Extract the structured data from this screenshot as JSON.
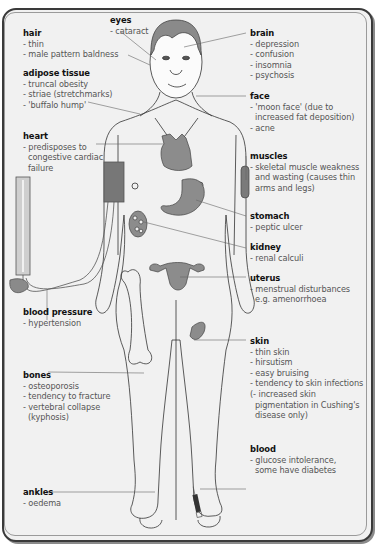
{
  "diagram": {
    "colors": {
      "background": "#f1f1f1",
      "frame": "#3a3a3a",
      "organ_fill": "#8c8c8c",
      "label_title": "#111111",
      "label_text": "#555555",
      "leader_line": "#666666"
    }
  },
  "labels": {
    "hair": {
      "title": "hair",
      "items": [
        "- thin",
        "- male pattern baldness"
      ]
    },
    "eyes": {
      "title": "eyes",
      "items": [
        "- cataract"
      ]
    },
    "adipose": {
      "title": "adipose tissue",
      "items": [
        "- truncal obesity",
        "- striae (stretchmarks)",
        "- 'buffalo hump'"
      ]
    },
    "heart": {
      "title": "heart",
      "items": [
        "- predisposes to",
        "congestive cardiac",
        "failure"
      ]
    },
    "blood_pressure": {
      "title": "blood pressure",
      "items": [
        "- hypertension"
      ]
    },
    "bones": {
      "title": "bones",
      "items": [
        "- osteoporosis",
        "- tendency to fracture",
        "- vertebral collapse",
        "(kyphosis)"
      ]
    },
    "ankles": {
      "title": "ankles",
      "items": [
        "- oedema"
      ]
    },
    "brain": {
      "title": "brain",
      "items": [
        "- depression",
        "- confusion",
        "- insomnia",
        "- psychosis"
      ]
    },
    "face": {
      "title": "face",
      "items": [
        "- 'moon face' (due to",
        "increased fat deposition)",
        "- acne"
      ]
    },
    "muscles": {
      "title": "muscles",
      "items": [
        "- skeletal muscle weakness",
        "and wasting (causes thin",
        "arms and legs)"
      ]
    },
    "stomach": {
      "title": "stomach",
      "items": [
        "- peptic ulcer"
      ]
    },
    "kidney": {
      "title": "kidney",
      "items": [
        "- renal calculi"
      ]
    },
    "uterus": {
      "title": "uterus",
      "items": [
        "- menstrual disturbances",
        "e.g. amenorrhoea"
      ]
    },
    "skin": {
      "title": "skin",
      "items": [
        "- thin skin",
        "- hirsutism",
        "- easy bruising",
        "- tendency to skin infections",
        "(- increased skin",
        "pigmentation in Cushing's",
        "disease only)"
      ]
    },
    "blood": {
      "title": "blood",
      "items": [
        "- glucose intolerance,",
        "some have diabetes"
      ]
    }
  }
}
